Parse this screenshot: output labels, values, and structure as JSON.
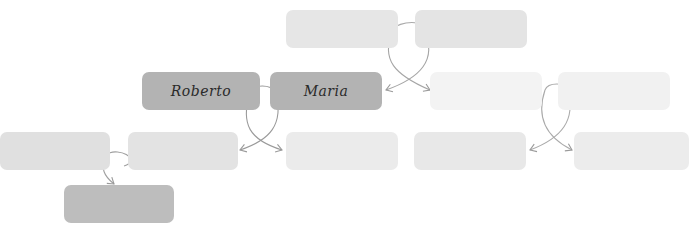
{
  "diagram": {
    "type": "family-tree",
    "heading_clipped": true,
    "colors": {
      "highlight": "#b3b3b3",
      "highlight_child": "#bdbdbd",
      "faint": "#e6e6e6",
      "faintest": "#f2f2f2",
      "connector": "#9a9a9a"
    },
    "people": [
      {
        "id": "gp1",
        "label": "",
        "generation": 0,
        "tone": "faint"
      },
      {
        "id": "gp2",
        "label": "",
        "generation": 0,
        "tone": "faint"
      },
      {
        "id": "roberto",
        "label": "Roberto",
        "generation": 1,
        "tone": "highlight"
      },
      {
        "id": "maria",
        "label": "Maria",
        "generation": 1,
        "tone": "highlight"
      },
      {
        "id": "p3",
        "label": "",
        "generation": 1,
        "tone": "faintest"
      },
      {
        "id": "p4",
        "label": "",
        "generation": 1,
        "tone": "faintest"
      },
      {
        "id": "c1",
        "label": "",
        "generation": 2,
        "tone": "faint"
      },
      {
        "id": "c2",
        "label": "",
        "generation": 2,
        "tone": "faint"
      },
      {
        "id": "c3",
        "label": "",
        "generation": 2,
        "tone": "faint"
      },
      {
        "id": "c4",
        "label": "",
        "generation": 2,
        "tone": "faint"
      },
      {
        "id": "c5",
        "label": "",
        "generation": 2,
        "tone": "faint"
      },
      {
        "id": "gc1",
        "label": "",
        "generation": 3,
        "tone": "highlight_child"
      }
    ],
    "relations": [
      {
        "type": "couple",
        "a": "gp1",
        "b": "gp2",
        "children": [
          "maria",
          "p3"
        ]
      },
      {
        "type": "couple",
        "a": "roberto",
        "b": "maria",
        "children": [
          "c2",
          "c3"
        ]
      },
      {
        "type": "couple",
        "a": "p3",
        "b": "p4",
        "children": [
          "c4",
          "c5"
        ]
      },
      {
        "type": "couple",
        "a": "c1",
        "b": "c2",
        "children": [
          "gc1"
        ]
      }
    ]
  }
}
